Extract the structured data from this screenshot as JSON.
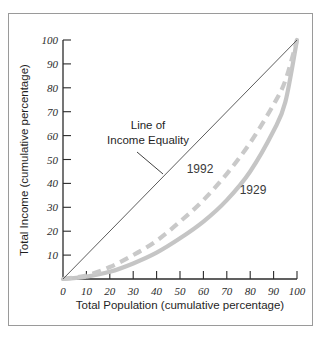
{
  "chart_data": {
    "type": "line",
    "title": "",
    "subtitle": "",
    "xlabel": "Total Population (cumulative percentage)",
    "ylabel": "Total Income (cumulative percentage)",
    "xlim": [
      0,
      100
    ],
    "ylim": [
      0,
      100
    ],
    "grid": false,
    "legend_position": "inline-annotations",
    "xticks": [
      "0",
      "10",
      "20",
      "30",
      "40",
      "50",
      "60",
      "70",
      "80",
      "90",
      "100"
    ],
    "yticks": [
      "10",
      "20",
      "30",
      "40",
      "50",
      "60",
      "70",
      "80",
      "90",
      "100"
    ],
    "xtick_values": [
      0,
      10,
      20,
      30,
      40,
      50,
      60,
      70,
      80,
      90,
      100
    ],
    "ytick_values": [
      10,
      20,
      30,
      40,
      50,
      60,
      70,
      80,
      90,
      100
    ],
    "annotations": [
      {
        "name": "line-of-income-equality",
        "text_line1": "Line of",
        "text_line2": "Income Equality",
        "points_to_x": 45,
        "points_to_y": 45
      }
    ],
    "series": [
      {
        "name": "Line of Income Equality",
        "label": "",
        "style": "solid-thin",
        "color": "#4a4a4a",
        "x": [
          0,
          100
        ],
        "values": [
          0,
          100
        ]
      },
      {
        "name": "1992",
        "label": "1992",
        "style": "dashed",
        "color": "#c9c9c9",
        "label_x": 63,
        "label_y": 47,
        "x": [
          0,
          10,
          20,
          30,
          40,
          50,
          60,
          70,
          80,
          90,
          95,
          100
        ],
        "values": [
          0,
          1.5,
          5,
          10,
          16,
          24,
          33,
          44,
          57,
          73,
          83,
          100
        ]
      },
      {
        "name": "1929",
        "label": "1929",
        "style": "solid-thick",
        "color": "#c5c5c5",
        "label_x": 79,
        "label_y": 38,
        "x": [
          0,
          10,
          20,
          30,
          40,
          50,
          60,
          70,
          80,
          90,
          95,
          100
        ],
        "values": [
          0,
          1,
          3,
          6.5,
          11,
          17,
          24,
          33,
          45,
          62,
          74,
          100
        ]
      }
    ]
  }
}
